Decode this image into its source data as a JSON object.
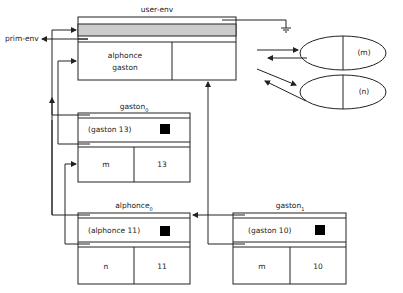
{
  "user_env": {
    "title": "user-env",
    "bindings": [
      "alphonce",
      "gaston"
    ],
    "parent_label": "prim-env"
  },
  "closures": [
    {
      "label": "(m)"
    },
    {
      "label": "(n)"
    }
  ],
  "frames": [
    {
      "title": "gaston",
      "subscript": "0",
      "call": "(gaston 13)",
      "param": "m",
      "value": "13"
    },
    {
      "title": "alphonce",
      "subscript": "0",
      "call": "(alphonce 11)",
      "param": "n",
      "value": "11"
    },
    {
      "title": "gaston",
      "subscript": "1",
      "call": "(gaston 10)",
      "param": "m",
      "value": "10"
    }
  ],
  "colors": {
    "stroke": "#222222",
    "shade": "#cccccc",
    "fill": "#000000"
  }
}
